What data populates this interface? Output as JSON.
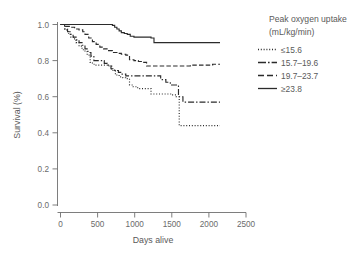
{
  "chart_data": {
    "type": "line",
    "subtype": "kaplan-meier-step",
    "title": "",
    "xlabel": "Days alive",
    "ylabel": "Survival (%)",
    "xlim": [
      0,
      2500
    ],
    "ylim": [
      0.0,
      1.0
    ],
    "xticks": [
      0,
      500,
      1000,
      1500,
      2000,
      2500
    ],
    "xtick_labels": [
      "0",
      "500",
      "1000",
      "1500",
      "2000",
      "2500"
    ],
    "yticks": [
      0.0,
      0.2,
      0.4,
      0.6,
      0.8,
      1.0
    ],
    "ytick_labels": [
      "0.0",
      "0.2",
      "0.4",
      "0.6",
      "0.8",
      "1.0"
    ],
    "grid": false,
    "legend_position": "right",
    "legend_title_line1": "Peak oxygen uptake",
    "legend_title_line2": "(mL/kg/min)",
    "series": [
      {
        "name": "≤15.6",
        "line_style": "dotted",
        "dash_pattern": "1,1.8",
        "final_survival": 0.44,
        "x": [
          0,
          60,
          100,
          140,
          175,
          210,
          250,
          290,
          330,
          360,
          400,
          430,
          470,
          520,
          560,
          600,
          640,
          690,
          740,
          790,
          840,
          880,
          930,
          980,
          1040,
          1100,
          1160,
          1220,
          1300,
          1400,
          1500,
          1560,
          1600,
          1650,
          1800,
          1950,
          2100,
          2150
        ],
        "y": [
          1.0,
          0.97,
          0.95,
          0.93,
          0.92,
          0.9,
          0.88,
          0.86,
          0.85,
          0.83,
          0.79,
          0.78,
          0.775,
          0.775,
          0.775,
          0.775,
          0.77,
          0.745,
          0.72,
          0.71,
          0.705,
          0.7,
          0.665,
          0.655,
          0.645,
          0.645,
          0.645,
          0.615,
          0.615,
          0.615,
          0.61,
          0.6,
          0.44,
          0.44,
          0.44,
          0.44,
          0.44,
          0.44
        ]
      },
      {
        "name": "15.7–19.6",
        "line_style": "dash-dot",
        "dash_pattern": "6,2,1.4,2",
        "final_survival": 0.57,
        "x": [
          0,
          55,
          95,
          130,
          170,
          210,
          250,
          290,
          330,
          370,
          410,
          450,
          500,
          545,
          590,
          630,
          680,
          730,
          780,
          830,
          880,
          930,
          990,
          1050,
          1110,
          1170,
          1230,
          1290,
          1350,
          1420,
          1480,
          1540,
          1590,
          1650,
          1750,
          1900,
          2050,
          2150
        ],
        "y": [
          1.0,
          0.975,
          0.96,
          0.945,
          0.93,
          0.915,
          0.9,
          0.885,
          0.865,
          0.845,
          0.825,
          0.8,
          0.8,
          0.8,
          0.785,
          0.775,
          0.755,
          0.745,
          0.735,
          0.725,
          0.715,
          0.715,
          0.715,
          0.715,
          0.715,
          0.715,
          0.715,
          0.715,
          0.695,
          0.68,
          0.665,
          0.665,
          0.6,
          0.57,
          0.57,
          0.57,
          0.57,
          0.57
        ]
      },
      {
        "name": "19.7–23.7",
        "line_style": "dashed",
        "dash_pattern": "4.5,2.2",
        "final_survival": 0.78,
        "x": [
          0,
          70,
          130,
          190,
          250,
          300,
          330,
          380,
          430,
          480,
          530,
          580,
          640,
          700,
          760,
          820,
          880,
          930,
          990,
          1050,
          1110,
          1160,
          1220,
          1300,
          1400,
          1500,
          1600,
          1750,
          1900,
          2050,
          2150
        ],
        "y": [
          1.0,
          0.99,
          0.985,
          0.975,
          0.97,
          0.96,
          0.945,
          0.925,
          0.905,
          0.89,
          0.875,
          0.865,
          0.855,
          0.845,
          0.84,
          0.835,
          0.83,
          0.805,
          0.8,
          0.795,
          0.79,
          0.77,
          0.77,
          0.77,
          0.77,
          0.77,
          0.77,
          0.775,
          0.775,
          0.78,
          0.78
        ]
      },
      {
        "name": "≥23.8",
        "line_style": "solid",
        "dash_pattern": "none",
        "final_survival": 0.9,
        "x": [
          0,
          120,
          260,
          400,
          540,
          660,
          700,
          730,
          760,
          790,
          820,
          860,
          900,
          940,
          990,
          1040,
          1100,
          1160,
          1220,
          1260,
          1320,
          1450,
          1600,
          1800,
          2000,
          2150
        ],
        "y": [
          1.0,
          1.0,
          1.0,
          1.0,
          1.0,
          1.0,
          0.995,
          0.985,
          0.975,
          0.965,
          0.955,
          0.95,
          0.945,
          0.935,
          0.93,
          0.93,
          0.93,
          0.93,
          0.925,
          0.9,
          0.9,
          0.9,
          0.9,
          0.9,
          0.9,
          0.9
        ]
      }
    ]
  },
  "legend": {
    "title_line1": "Peak oxygen uptake",
    "title_line2": "(mL/kg/min)",
    "entries": [
      {
        "label": "≤15.6"
      },
      {
        "label": "15.7–19.6"
      },
      {
        "label": "19.7–23.7"
      },
      {
        "label": "≥23.8"
      }
    ]
  },
  "axes": {
    "x_title": "Days alive",
    "y_title": "Survival (%)",
    "x_tick_labels": [
      "0",
      "500",
      "1000",
      "1500",
      "2000",
      "2500"
    ],
    "y_tick_labels": [
      "0.0",
      "0.2",
      "0.4",
      "0.6",
      "0.8",
      "1.0"
    ]
  },
  "colors": {
    "line": "#2b2b2b",
    "axis": "#6f6f6f",
    "text": "#5a5a5a",
    "background": "#ffffff"
  }
}
